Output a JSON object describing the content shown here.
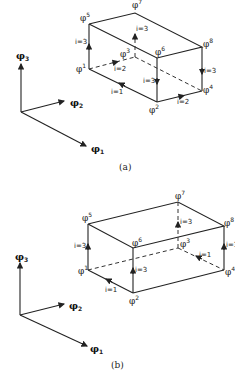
{
  "panels": [
    {
      "caption": "(a)",
      "axes": {
        "x1": "φ",
        "x1_sub": "1",
        "x2": "φ",
        "x2_sub": "2",
        "x3": "φ",
        "x3_sub": "3"
      },
      "nodes": [
        {
          "id": "1",
          "label": "φ",
          "sup": "1"
        },
        {
          "id": "2",
          "label": "φ",
          "sup": "2"
        },
        {
          "id": "3",
          "label": "φ",
          "sup": "3"
        },
        {
          "id": "4",
          "label": "φ",
          "sup": "4"
        },
        {
          "id": "5",
          "label": "φ",
          "sup": "5"
        },
        {
          "id": "6",
          "label": "φ",
          "sup": "6"
        },
        {
          "id": "7",
          "label": "φ",
          "sup": "7"
        },
        {
          "id": "8",
          "label": "φ",
          "sup": "8"
        }
      ],
      "edge_labels": [
        "i=3",
        "i=3",
        "i=2",
        "i=1",
        "i=3",
        "i=3",
        "i=2"
      ]
    },
    {
      "caption": "(b)",
      "axes": {
        "x1": "φ",
        "x1_sub": "1",
        "x2": "φ",
        "x2_sub": "2",
        "x3": "φ",
        "x3_sub": "3"
      },
      "nodes": [
        {
          "id": "1",
          "label": "φ",
          "sup": "1"
        },
        {
          "id": "2",
          "label": "φ",
          "sup": "2"
        },
        {
          "id": "3",
          "label": "φ",
          "sup": "3"
        },
        {
          "id": "4",
          "label": "φ",
          "sup": "4"
        },
        {
          "id": "5",
          "label": "φ",
          "sup": "5"
        },
        {
          "id": "6",
          "label": "φ",
          "sup": "6"
        },
        {
          "id": "7",
          "label": "φ",
          "sup": "7"
        },
        {
          "id": "8",
          "label": "φ",
          "sup": "8"
        }
      ],
      "edge_labels": [
        "i=3",
        "i=3",
        "i=3",
        "i=1",
        "i=1",
        "i=3"
      ]
    }
  ]
}
